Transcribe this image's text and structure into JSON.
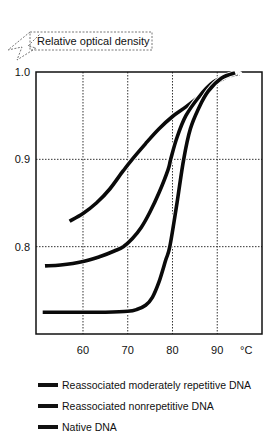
{
  "chart_data": {
    "type": "line",
    "title": "",
    "ylabel": "Relative optical density",
    "xlabel": "°C",
    "xlim": [
      49.5,
      100
    ],
    "ylim": [
      0.7,
      1.0
    ],
    "x_ticks": [
      60,
      70,
      80,
      90
    ],
    "x_tick_labels": [
      "60",
      "70",
      "80",
      "90"
    ],
    "y_ticks": [
      0.8,
      0.9,
      1.0
    ],
    "y_tick_labels": [
      "0.8",
      "0.9",
      "1.0"
    ],
    "x_unit_label": "°C",
    "grid": true,
    "legend_position": "below",
    "series": [
      {
        "name": "Reassociated moderately repetitive DNA",
        "x": [
          57,
          60,
          63,
          66,
          69,
          71,
          74,
          77,
          80,
          83,
          86,
          89,
          92,
          95
        ],
        "y": [
          0.829,
          0.838,
          0.85,
          0.866,
          0.887,
          0.9,
          0.918,
          0.935,
          0.949,
          0.96,
          0.972,
          0.985,
          0.994,
          0.998
        ]
      },
      {
        "name": "Reassociated nonrepetitive DNA",
        "x": [
          51.5,
          55,
          60,
          64,
          67,
          69,
          71,
          73,
          75,
          77,
          79,
          79.6,
          81,
          83,
          86,
          89,
          92,
          94.5
        ],
        "y": [
          0.778,
          0.779,
          0.783,
          0.789,
          0.795,
          0.8,
          0.809,
          0.822,
          0.84,
          0.862,
          0.888,
          0.9,
          0.925,
          0.95,
          0.972,
          0.988,
          0.995,
          0.998
        ]
      },
      {
        "name": "Native DNA",
        "x": [
          51,
          55,
          60,
          65,
          70,
          72,
          74,
          75.5,
          77,
          78.5,
          79.4,
          81,
          82.5,
          84,
          86,
          88,
          91,
          94
        ],
        "y": [
          0.725,
          0.725,
          0.725,
          0.725,
          0.726,
          0.728,
          0.733,
          0.742,
          0.76,
          0.785,
          0.8,
          0.85,
          0.9,
          0.935,
          0.96,
          0.978,
          0.993,
          0.999
        ]
      }
    ]
  },
  "axis": {
    "ylabel": "Relative optical density",
    "x_unit": "°C"
  },
  "legend": [
    {
      "label": "Reassociated moderately repetitive DNA"
    },
    {
      "label": "Reassociated nonrepetitive DNA"
    },
    {
      "label": "Native DNA"
    }
  ]
}
